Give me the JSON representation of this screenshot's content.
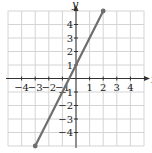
{
  "chart_data": {
    "type": "line",
    "title": "",
    "xlabel": "x",
    "ylabel": "y",
    "xlim": [
      -5,
      5
    ],
    "ylim": [
      -5,
      5
    ],
    "grid": true,
    "x_ticks": [
      -4,
      -3,
      -2,
      -1,
      1,
      2,
      3,
      4
    ],
    "y_ticks": [
      -4,
      -3,
      -2,
      -1,
      1,
      2,
      3,
      4
    ],
    "x_tick_labels": [
      "−4",
      "−3",
      "−2",
      "−1",
      "1",
      "2",
      "3",
      "4"
    ],
    "y_tick_labels": [
      "−4",
      "−3",
      "−2",
      "−1",
      "1",
      "2",
      "3",
      "4"
    ],
    "series": [
      {
        "name": "y = 2x + 1",
        "equation": "y = 2x + 1",
        "x": [
          -3,
          2
        ],
        "y": [
          -5,
          5
        ],
        "endpoints_marked": true,
        "color": "#6e6e6e"
      }
    ],
    "legend": null
  },
  "colors": {
    "grid": "#d4d4d4",
    "axis": "#333333",
    "line": "#6e6e6e"
  },
  "labels": {
    "x_axis": "x",
    "y_axis": "y"
  }
}
